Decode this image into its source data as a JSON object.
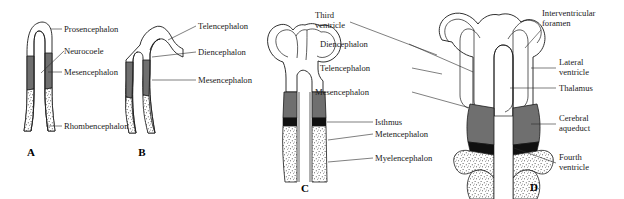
{
  "figure": {
    "background_color": "#ffffff",
    "colors": {
      "outline": "#1a1a1a",
      "gray_fill": "#6f6f6f",
      "dark_fill": "#101010",
      "stipple": "#3a3a3a",
      "label_text": "#1a1a1a",
      "leader_line": "#2a2a2a"
    }
  },
  "panels": [
    {
      "id": "A",
      "letter": "A",
      "labels": [
        {
          "key": "prosencephalon",
          "text": "Prosencephalon"
        },
        {
          "key": "neurocoele",
          "text": "Neurocoele"
        },
        {
          "key": "mesencephalon",
          "text": "Mesencephalon"
        },
        {
          "key": "rhombencephalon",
          "text": "Rhombencephalon"
        }
      ]
    },
    {
      "id": "B",
      "letter": "B",
      "labels": [
        {
          "key": "telencephalon",
          "text": "Telencephalon"
        },
        {
          "key": "diencephalon",
          "text": "Diencephalon"
        },
        {
          "key": "mesencephalon",
          "text": "Mesencephalon"
        }
      ]
    },
    {
      "id": "C",
      "letter": "C",
      "labels": [
        {
          "key": "isthmus",
          "text": "Isthmus"
        },
        {
          "key": "metencephalon",
          "text": "Metencephalon"
        },
        {
          "key": "myelencephalon",
          "text": "Myelencephalon"
        }
      ]
    },
    {
      "id": "D",
      "letter": "D",
      "labels_left": [
        {
          "key": "third_ventricle_l1",
          "text": "Third"
        },
        {
          "key": "third_ventricle_l2",
          "text": "ventricle"
        },
        {
          "key": "diencephalon",
          "text": "Diencephalon"
        },
        {
          "key": "telencephalon",
          "text": "Telencephalon"
        },
        {
          "key": "mesencephalon",
          "text": "Mesencephalon"
        }
      ],
      "labels_right": [
        {
          "key": "interventricular_foramen_l1",
          "text": "Interventricular"
        },
        {
          "key": "interventricular_foramen_l2",
          "text": "foramen"
        },
        {
          "key": "lateral_ventricle_l1",
          "text": "Lateral"
        },
        {
          "key": "lateral_ventricle_l2",
          "text": "ventricle"
        },
        {
          "key": "thalamus",
          "text": "Thalamus"
        },
        {
          "key": "cerebral_aqueduct_l1",
          "text": "Cerebral"
        },
        {
          "key": "cerebral_aqueduct_l2",
          "text": "aqueduct"
        },
        {
          "key": "fourth_ventricle_l1",
          "text": "Fourth"
        },
        {
          "key": "fourth_ventricle_l2",
          "text": "ventricle"
        }
      ]
    }
  ]
}
